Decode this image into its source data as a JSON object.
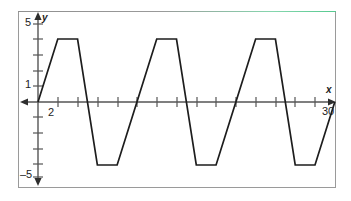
{
  "figure": {
    "kind": "coordinate-grid-graph",
    "frame_color": "#9a9a9a",
    "accent_color": "#55c98f",
    "curve_color": "#1d1d1d",
    "axis_color": "#4a4a4a",
    "background": "#ffffff"
  },
  "axes": {
    "y_axis_name": "y",
    "x_axis_name": "x",
    "y_tick_labels": [
      "5",
      "1",
      "-5"
    ],
    "x_tick_labels": [
      "2",
      "30"
    ]
  },
  "labels": {
    "y5": "5",
    "y1": "1",
    "yneg5": "–5",
    "x2": "2",
    "x30": "30",
    "y_name": "y",
    "x_name": "x"
  },
  "chart_data": {
    "type": "line",
    "title": "",
    "subtitle": "",
    "xlabel": "x",
    "ylabel": "y",
    "xlim": [
      0,
      31
    ],
    "ylim": [
      -5.6,
      5.6
    ],
    "grid": false,
    "legend": "none",
    "x_ticks": [
      2,
      4,
      6,
      8,
      10,
      12,
      14,
      16,
      18,
      20,
      22,
      24,
      26,
      28,
      30
    ],
    "x_tick_labels_shown": {
      "2": "2",
      "30": "30"
    },
    "y_ticks": [
      -5,
      -4,
      -3,
      -2,
      -1,
      1,
      2,
      3,
      4,
      5
    ],
    "y_tick_labels_shown": {
      "5": "5",
      "1": "1",
      "-5": "-5"
    },
    "waveform": "trapezoidal",
    "amplitude": 4,
    "period": 10,
    "series": [
      {
        "name": "trapezoidal wave",
        "points": [
          [
            0,
            0
          ],
          [
            2,
            4
          ],
          [
            4,
            4
          ],
          [
            6,
            -4
          ],
          [
            8,
            -4
          ],
          [
            10,
            0
          ],
          [
            12,
            4
          ],
          [
            14,
            4
          ],
          [
            16,
            -4
          ],
          [
            18,
            -4
          ],
          [
            20,
            0
          ],
          [
            22,
            4
          ],
          [
            24,
            4
          ],
          [
            26,
            -4
          ],
          [
            28,
            -4
          ],
          [
            30,
            0
          ]
        ]
      }
    ],
    "peaks": [
      {
        "x_start": 2,
        "x_end": 4,
        "y": 4
      },
      {
        "x_start": 12,
        "x_end": 14,
        "y": 4
      },
      {
        "x_start": 22,
        "x_end": 24,
        "y": 4
      }
    ],
    "troughs": [
      {
        "x_start": 6,
        "x_end": 8,
        "y": -4
      },
      {
        "x_start": 16,
        "x_end": 18,
        "y": -4
      },
      {
        "x_start": 26,
        "x_end": 28,
        "y": -4
      }
    ]
  }
}
